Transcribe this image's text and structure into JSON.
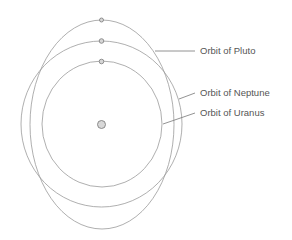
{
  "diagram": {
    "labels": {
      "pluto": "Orbit of Pluto",
      "neptune": "Orbit of Neptune",
      "uranus": "Orbit of Uranus"
    },
    "colors": {
      "orbit_stroke": "#9a9a9a",
      "planet_fill": "#d6d6d6",
      "text": "#555555"
    }
  }
}
